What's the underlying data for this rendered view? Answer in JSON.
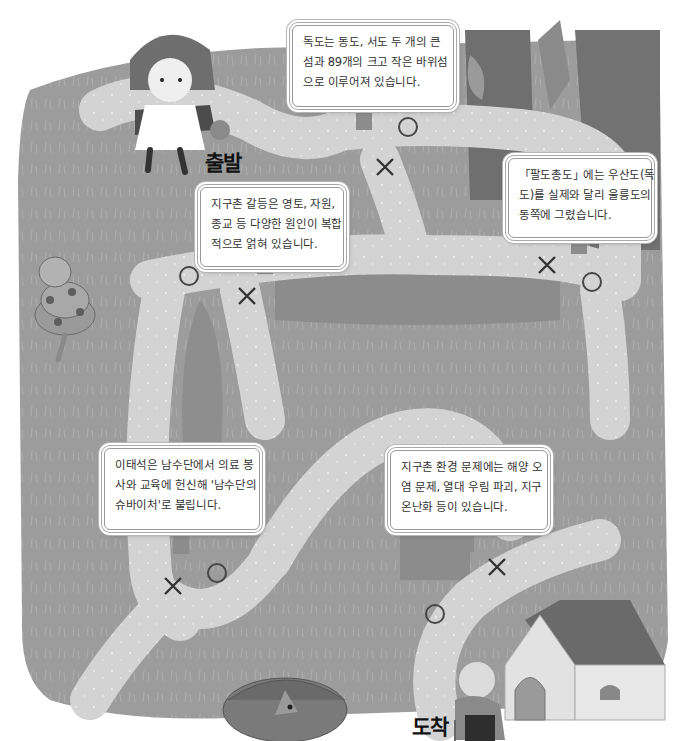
{
  "scene": {
    "description": "Maze path O/X quiz illustration (grayscale)",
    "colors": {
      "grass": "#9e9e9e",
      "grass_dark": "#8a8a8a",
      "path": "#d4d4d4",
      "sign_bg": "#ffffff",
      "mark": "#464646",
      "tree": "#6f6f6f",
      "roof": "#707070",
      "house_wall": "#e6e6e6"
    },
    "start_label": "출발",
    "end_label": "도착"
  },
  "signs": [
    {
      "id": "sign-dokdo",
      "lines": [
        "독도는 동도, 서도 두 개의 큰",
        "섬과 89개의 크고 작은 바위섬",
        "으로 이루어져 있습니다."
      ],
      "marks": [
        "O",
        "X"
      ]
    },
    {
      "id": "sign-conflict",
      "lines": [
        "지구촌 갈등은 영토, 자원,",
        "종교 등 다양한 원인이 복합",
        "적으로 얽혀 있습니다."
      ],
      "marks": [
        "O",
        "X"
      ]
    },
    {
      "id": "sign-paldo",
      "lines": [
        "「팔도총도」에는 우산도(독",
        "도)를 실제와 달리 울릉도의",
        "동쪽에 그렸습니다."
      ],
      "marks": [
        "X",
        "O"
      ]
    },
    {
      "id": "sign-leetaeseok",
      "lines": [
        "이태석은 남수단에서 의료 봉",
        "사와 교육에 헌신해 '남수단의",
        "슈바이처'로 불립니다."
      ],
      "marks": [
        "X",
        "O"
      ]
    },
    {
      "id": "sign-environment",
      "lines": [
        "지구촌 환경 문제에는 해양 오",
        "염 문제, 열대 우림 파괴, 지구",
        "온난화 등이 있습니다."
      ],
      "marks": [
        "O",
        "X"
      ]
    }
  ],
  "icons": {
    "circle": "O-mark",
    "cross": "X-mark"
  }
}
